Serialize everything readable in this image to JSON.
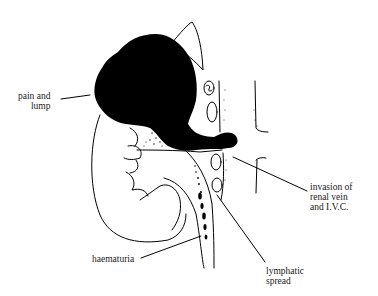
{
  "figure": {
    "colors": {
      "ink": "#000000",
      "background": "#ffffff"
    },
    "labels": {
      "pain_lump": {
        "line1": "pain and",
        "line2": "lump"
      },
      "invasion": {
        "line1": "invasion of",
        "line2": "renal vein",
        "line3": "and I.V.C."
      },
      "haematuria": {
        "line1": "haematuria"
      },
      "lymphatic": {
        "line1": "lymphatic",
        "line2": "spread"
      }
    }
  }
}
